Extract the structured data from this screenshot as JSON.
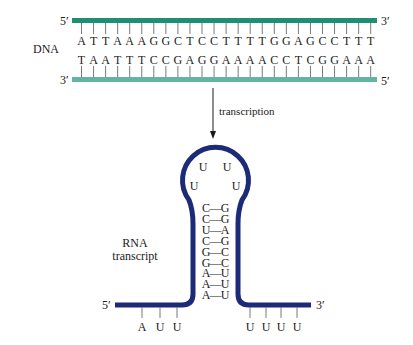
{
  "colors": {
    "dna_top_strand": "#1f8f74",
    "dna_bottom_strand": "#62b5a3",
    "rna_strand": "#1c2a78",
    "tick": "#7a7a7a",
    "text": "#1a1a1a"
  },
  "dna": {
    "label": "DNA",
    "top_strand": {
      "left_end": "5′",
      "right_end": "3′",
      "sequence": [
        "A",
        "T",
        "T",
        "A",
        "A",
        "A",
        "G",
        "G",
        "C",
        "T",
        "C",
        "C",
        "T",
        "T",
        "T",
        "T",
        "G",
        "G",
        "A",
        "G",
        "C",
        "C",
        "T",
        "T",
        "T"
      ]
    },
    "bottom_strand": {
      "left_end": "3′",
      "right_end": "5′",
      "sequence": [
        "T",
        "A",
        "A",
        "T",
        "T",
        "T",
        "C",
        "C",
        "G",
        "A",
        "G",
        "G",
        "A",
        "A",
        "A",
        "A",
        "C",
        "C",
        "T",
        "C",
        "G",
        "G",
        "A",
        "A",
        "A"
      ]
    }
  },
  "process": {
    "arrow_label": "transcription"
  },
  "rna": {
    "label_line1": "RNA",
    "label_line2": "transcript",
    "left_end": "5′",
    "right_end": "3′",
    "loop_bases": [
      "U",
      "U",
      "U",
      "U"
    ],
    "stem_pairs": [
      {
        "left": "C",
        "right": "G"
      },
      {
        "left": "C",
        "right": "G"
      },
      {
        "left": "U",
        "right": "A"
      },
      {
        "left": "C",
        "right": "G"
      },
      {
        "left": "G",
        "right": "C"
      },
      {
        "left": "G",
        "right": "C"
      },
      {
        "left": "A",
        "right": "U"
      },
      {
        "left": "A",
        "right": "U"
      },
      {
        "left": "A",
        "right": "U"
      }
    ],
    "bond_glyph": "—",
    "left_tail_bases": [
      "A",
      "U",
      "U"
    ],
    "right_tail_bases": [
      "U",
      "U",
      "U",
      "U"
    ]
  }
}
